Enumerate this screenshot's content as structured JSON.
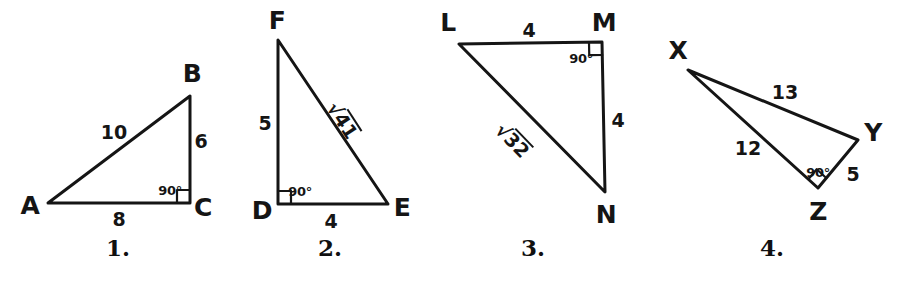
{
  "page": {
    "background_color": "#ffffff",
    "ink_color": "#151515",
    "width": 904,
    "height": 281
  },
  "figures": [
    {
      "id": "figure-1",
      "caption": "1.",
      "caption_pos": {
        "x": 118,
        "y": 247
      },
      "vertices": [
        {
          "name": "A",
          "label": "A",
          "x": 48,
          "y": 203,
          "label_x": 30,
          "label_y": 205
        },
        {
          "name": "B",
          "label": "B",
          "x": 190,
          "y": 96,
          "label_x": 192,
          "label_y": 73
        },
        {
          "name": "C",
          "label": "C",
          "x": 190,
          "y": 203,
          "label_x": 203,
          "label_y": 207
        }
      ],
      "edges": [
        {
          "from": "A",
          "to": "B",
          "label": "10",
          "label_x": 114,
          "label_y": 132
        },
        {
          "from": "B",
          "to": "C",
          "label": "6",
          "label_x": 201,
          "label_y": 141
        },
        {
          "from": "A",
          "to": "C",
          "label": "8",
          "label_x": 119,
          "label_y": 219
        }
      ],
      "angle_marks": [
        {
          "at": "C",
          "label": "90°",
          "label_x": 170,
          "label_y": 190
        }
      ]
    },
    {
      "id": "figure-2",
      "caption": "2.",
      "caption_pos": {
        "x": 330,
        "y": 247
      },
      "vertices": [
        {
          "name": "F",
          "label": "F",
          "x": 278,
          "y": 40,
          "label_x": 277,
          "label_y": 20
        },
        {
          "name": "D",
          "label": "D",
          "x": 278,
          "y": 204,
          "label_x": 262,
          "label_y": 210
        },
        {
          "name": "E",
          "label": "E",
          "x": 388,
          "y": 204,
          "label_x": 402,
          "label_y": 207
        }
      ],
      "edges": [
        {
          "from": "F",
          "to": "D",
          "label": "5",
          "label_x": 265,
          "label_y": 123
        },
        {
          "from": "D",
          "to": "E",
          "label": "4",
          "label_x": 331,
          "label_y": 221
        },
        {
          "from": "F",
          "to": "E",
          "label": "√41",
          "radicand": "41",
          "label_x": 343,
          "label_y": 120,
          "rotation_deg": 57
        }
      ],
      "angle_marks": [
        {
          "at": "D",
          "label": "90°",
          "label_x": 300,
          "label_y": 191
        }
      ]
    },
    {
      "id": "figure-3",
      "caption": "3.",
      "caption_pos": {
        "x": 533,
        "y": 247
      },
      "vertices": [
        {
          "name": "L",
          "label": "L",
          "x": 459,
          "y": 44,
          "label_x": 448,
          "label_y": 22
        },
        {
          "name": "M",
          "label": "M",
          "x": 602,
          "y": 42,
          "label_x": 604,
          "label_y": 22
        },
        {
          "name": "N",
          "label": "N",
          "x": 605,
          "y": 192,
          "label_x": 606,
          "label_y": 214
        }
      ],
      "edges": [
        {
          "from": "L",
          "to": "M",
          "label": "4",
          "label_x": 529,
          "label_y": 30
        },
        {
          "from": "M",
          "to": "N",
          "label": "4",
          "label_x": 618,
          "label_y": 120
        },
        {
          "from": "L",
          "to": "N",
          "label": "√32",
          "radicand": "32",
          "label_x": 513,
          "label_y": 140,
          "rotation_deg": 46
        }
      ],
      "angle_marks": [
        {
          "at": "M",
          "label": "90°",
          "label_x": 581,
          "label_y": 58
        }
      ]
    },
    {
      "id": "figure-4",
      "caption": "4.",
      "caption_pos": {
        "x": 772,
        "y": 247
      },
      "vertices": [
        {
          "name": "X",
          "label": "X",
          "x": 688,
          "y": 70,
          "label_x": 678,
          "label_y": 50
        },
        {
          "name": "Y",
          "label": "Y",
          "x": 858,
          "y": 140,
          "label_x": 873,
          "label_y": 132
        },
        {
          "name": "Z",
          "label": "Z",
          "x": 818,
          "y": 188,
          "label_x": 818,
          "label_y": 211
        }
      ],
      "edges": [
        {
          "from": "X",
          "to": "Y",
          "label": "13",
          "label_x": 785,
          "label_y": 92
        },
        {
          "from": "X",
          "to": "Z",
          "label": "12",
          "label_x": 748,
          "label_y": 148
        },
        {
          "from": "Z",
          "to": "Y",
          "label": "5",
          "label_x": 853,
          "label_y": 174
        }
      ],
      "angle_marks": [
        {
          "at": "Z",
          "label": "90°",
          "label_x": 818,
          "label_y": 172
        }
      ]
    }
  ]
}
